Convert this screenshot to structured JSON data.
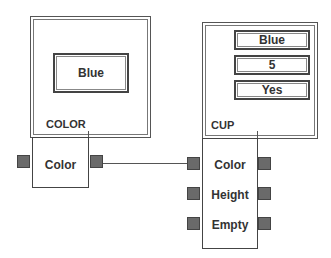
{
  "color_object": {
    "frame_label": "COLOR",
    "fields": [
      {
        "value": "Blue"
      }
    ],
    "node": {
      "label": "Color",
      "ports": [
        {
          "name": "Color"
        }
      ]
    }
  },
  "cup_object": {
    "frame_label": "CUP",
    "fields": [
      {
        "value": "Blue"
      },
      {
        "value": "5"
      },
      {
        "value": "Yes"
      }
    ],
    "node": {
      "ports": [
        {
          "label": "Color"
        },
        {
          "label": "Height"
        },
        {
          "label": "Empty"
        }
      ]
    }
  },
  "connections": [
    {
      "from": "COLOR.Color.out",
      "to": "CUP.Color.in"
    }
  ],
  "colors": {
    "port_fill": "#6a6a6a",
    "border": "#444444"
  }
}
